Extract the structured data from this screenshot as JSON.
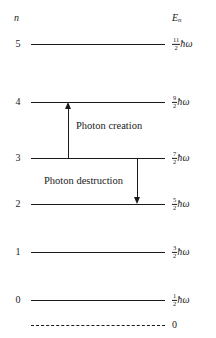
{
  "figure": {
    "headers": {
      "left": "n",
      "right_symbol": "E",
      "right_subscript": "n"
    },
    "levels": [
      {
        "n": "5",
        "numerator": "11",
        "denominator": "2",
        "unit": "ħω",
        "energy_text": "11/2 ħω"
      },
      {
        "n": "4",
        "numerator": "9",
        "denominator": "2",
        "unit": "ħω",
        "energy_text": "9/2 ħω"
      },
      {
        "n": "3",
        "numerator": "7",
        "denominator": "2",
        "unit": "ħω",
        "energy_text": "7/2 ħω"
      },
      {
        "n": "2",
        "numerator": "5",
        "denominator": "2",
        "unit": "ħω",
        "energy_text": "5/2 ħω"
      },
      {
        "n": "1",
        "numerator": "3",
        "denominator": "2",
        "unit": "ħω",
        "energy_text": "3/2 ħω"
      },
      {
        "n": "0",
        "numerator": "1",
        "denominator": "2",
        "unit": "ħω",
        "energy_text": "1/2 ħω"
      }
    ],
    "baseline": {
      "label": "0",
      "style": "dashed"
    },
    "transitions": [
      {
        "label": "Photon creation",
        "direction": "up",
        "from_level": "3",
        "to_level": "4"
      },
      {
        "label": "Photon destruction",
        "direction": "down",
        "from_level": "3",
        "to_level": "2"
      }
    ],
    "colors": {
      "ink": "#1a1a1a",
      "background": "#ffffff"
    }
  }
}
